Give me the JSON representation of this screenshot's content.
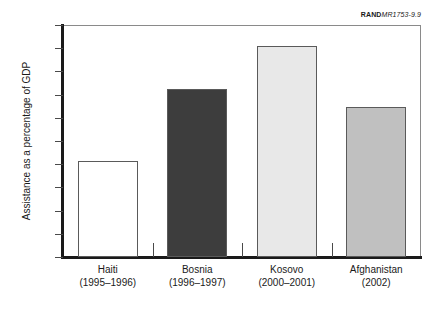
{
  "source_credit": {
    "mark": "RAND",
    "document": "MR1753-9.9"
  },
  "chart_data": {
    "type": "bar",
    "title": "",
    "subtitle": "",
    "xlabel": "",
    "ylabel": "Assistance as a percentage of GDP",
    "ylim": [
      0,
      50
    ],
    "yticks": [
      "0",
      "5",
      "10",
      "15",
      "20",
      "25",
      "30",
      "35",
      "40",
      "45",
      "50"
    ],
    "ytick_values": [
      0,
      5,
      10,
      15,
      20,
      25,
      30,
      35,
      40,
      45,
      50
    ],
    "grid": false,
    "legend": "none",
    "categories": [
      "Haiti",
      "Bosnia",
      "Kosovo",
      "Afghanistan"
    ],
    "category_periods": [
      "(1995–1996)",
      "(1996–1997)",
      "(2000–2001)",
      "(2002)"
    ],
    "values": [
      20.7,
      36.2,
      45.4,
      32.3
    ],
    "bar_colors": [
      "#ffffff",
      "#3d3d3d",
      "#e8e8e8",
      "#c0c0c0"
    ],
    "bar_edge_color": "#5a5a5a",
    "axis_color": "#1a1a1a",
    "frame_color": "#8a8a8a",
    "background": "#ffffff"
  }
}
